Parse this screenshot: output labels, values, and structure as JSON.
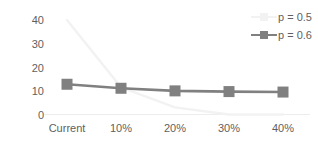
{
  "chart_data": {
    "type": "line",
    "title": "",
    "xlabel": "",
    "ylabel": "",
    "categories": [
      "Current",
      "10%",
      "20%",
      "30%",
      "40%"
    ],
    "yticks": [
      0,
      10,
      20,
      30,
      40
    ],
    "ylim": [
      0,
      40
    ],
    "grid": false,
    "legend_position": "top-right",
    "series": [
      {
        "name": "p = 0.5",
        "color": "#f2f2f2",
        "marker": "square",
        "values": [
          40,
          11.5,
          3,
          0,
          0
        ]
      },
      {
        "name": "p = 0.6",
        "color": "#808080",
        "marker": "square",
        "values": [
          12.8,
          11.1,
          10.0,
          9.7,
          9.5
        ]
      }
    ]
  },
  "axes": {
    "y_tick_labels": [
      "40",
      "30",
      "20",
      "10",
      "0"
    ],
    "x_tick_labels": [
      "Current",
      "10%",
      "20%",
      "30%",
      "40%"
    ]
  },
  "legend": {
    "items": [
      {
        "label": "p = 0.5",
        "color": "#f2f2f2"
      },
      {
        "label": "p = 0.6",
        "color": "#808080"
      }
    ]
  },
  "colors": {
    "text": "#5f5f5f",
    "axis": "#ededed",
    "series_1": "#f2f2f2",
    "series_2": "#808080",
    "background": "#ffffff"
  }
}
